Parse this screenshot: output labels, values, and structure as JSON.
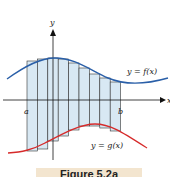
{
  "figure": {
    "caption": "Figure 5.2a",
    "labels": {
      "y_axis": "y",
      "x_axis": "x",
      "a": "a",
      "b": "b",
      "f_curve": "y = f(x)",
      "g_curve": "y = g(x)"
    },
    "colors": {
      "f_curve": "#2a5fa8",
      "g_curve": "#d62a2a",
      "fill": "#d8e8f3",
      "axes": "#111111",
      "caption_bg": "#f3e5cf"
    },
    "num_strips": 9
  }
}
